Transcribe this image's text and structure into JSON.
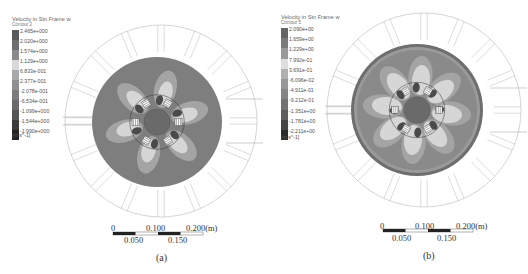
{
  "panels": [
    {
      "id": "a",
      "caption": "(a)",
      "legend": {
        "title": "Velocity in Stn Frame w",
        "contour": "Contour 2",
        "levels": [
          "2.465e+000",
          "2.020e+000",
          "1.574e+000",
          "1.129e+000",
          "6.833e-001",
          "2.377e-001",
          "-2.078e-001",
          "-6.534e-001",
          "-1.099e+000",
          "-1.544e+000",
          "-1.990e+000"
        ],
        "colors": [
          "#5a5a5a",
          "#6e6e6e",
          "#8a8a8a",
          "#d8d8d8",
          "#a8a8a8",
          "#909090",
          "#7c7c7c",
          "#6a6a6a",
          "#555555",
          "#3c3c3c",
          "#222222"
        ],
        "unit": "[m s^-1]"
      },
      "scale": {
        "top_labels": [
          "0",
          "0.100",
          "0.200(m)"
        ],
        "bottom_labels": [
          "0.050",
          "0.150"
        ]
      }
    },
    {
      "id": "b",
      "caption": "(b)",
      "legend": {
        "title": "Velocity in Stn Frame w",
        "contour": "Contour 5",
        "levels": [
          "2.090e+00",
          "1.659e+00",
          "1.229e+00",
          "7.992e-01",
          "3.691e-01",
          "-6.096e-02",
          "-4.911e-01",
          "-9.212e-01",
          "-1.351e+00",
          "-1.781e+00",
          "-2.211e+00"
        ],
        "colors": [
          "#646464",
          "#7a7a7a",
          "#9a9a9a",
          "#dedede",
          "#b0b0b0",
          "#989898",
          "#858585",
          "#727272",
          "#5e5e5e",
          "#464646",
          "#2c2c2c"
        ],
        "unit": "[m s^-1]"
      },
      "scale": {
        "top_labels": [
          "0",
          "0.100",
          "0.200(m)"
        ],
        "bottom_labels": [
          "0.050",
          "0.150"
        ]
      }
    }
  ],
  "colors": {
    "ring_line": "#b8b8b8",
    "disc_base_a": "#7e7e7e",
    "disc_base_b": "#8a8a8a",
    "lobe_light": "#d6d6d6",
    "lobe_mid": "#a4a4a4",
    "lobe_dark": "#4a4a4a"
  }
}
